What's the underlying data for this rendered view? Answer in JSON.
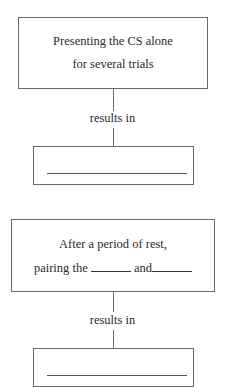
{
  "diagram": {
    "flow1": {
      "step_box": {
        "line1": "Presenting the CS alone",
        "line2": "for several trials"
      },
      "connector_label": "results in",
      "result_box": {
        "answer": ""
      }
    },
    "flow2": {
      "step_box": {
        "line1": "After a period of rest,",
        "line2_prefix": "pairing the",
        "line2_middle": "and",
        "blank1": "",
        "blank2": ""
      },
      "connector_label": "results in",
      "result_box": {
        "answer": ""
      }
    }
  }
}
